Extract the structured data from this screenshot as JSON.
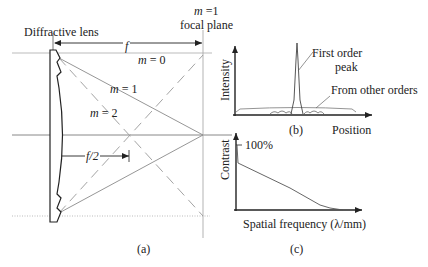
{
  "panel_a": {
    "lens_label": "Diffractive lens",
    "focal_plane_order": "m =1",
    "focal_plane_label": "focal plane",
    "focal_length_label": "f",
    "half_focal_label": "f/2",
    "order_m0": "m = 0",
    "order_m1": "m = 1",
    "order_m2": "m = 2",
    "caption": "(a)"
  },
  "panel_b": {
    "ylabel": "Intensity",
    "xlabel": "Position",
    "peak_annotation_line1": "First order",
    "peak_annotation_line2": "peak",
    "other_annotation": "From other orders",
    "caption": "(b)"
  },
  "panel_c": {
    "ylabel": "Contrast",
    "xlabel": "Spatial frequency (λ/mm)",
    "tick_label": "100%",
    "caption": "(c)"
  },
  "colors": {
    "ink": "#222222",
    "guide": "#9a9a9a",
    "ray": "#8a8a8a"
  }
}
